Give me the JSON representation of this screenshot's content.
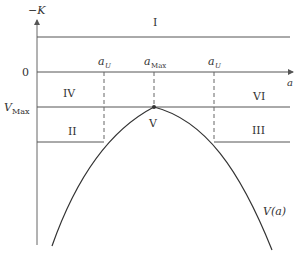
{
  "axes": {
    "y_label": "−K",
    "x_label": "a",
    "zero_label": "0",
    "vmax_label_main": "V",
    "vmax_label_sub": "Max"
  },
  "regions": {
    "I": "I",
    "II": "II",
    "III": "III",
    "IV": "IV",
    "V": "V",
    "VI": "VI"
  },
  "markers": {
    "aU_left_main": "a",
    "aU_left_sub": "U",
    "aMax_main": "a",
    "aMax_sub": "Max",
    "aU_right_main": "a",
    "aU_right_sub": "U"
  },
  "curve": {
    "label": "V(a)"
  },
  "colors": {
    "line": "#555555",
    "curve": "#333333",
    "dash": "#666666"
  }
}
